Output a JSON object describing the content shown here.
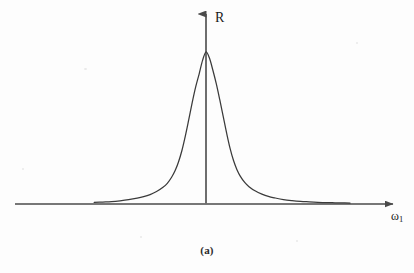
{
  "figure": {
    "caption": "(a)",
    "y_axis_label": "R",
    "x_axis_label_base": "ω",
    "x_axis_label_sub": "1",
    "line_color": "#3a3a3a",
    "axis_color": "#4a4a4a",
    "background_color": "#fdfdfd"
  },
  "chart_data": {
    "type": "line",
    "title": "",
    "subtitle": "",
    "xlabel": "ω₁",
    "ylabel": "R",
    "caption": "(a)",
    "grid": false,
    "legend": null,
    "axis_style": "arrow-headed half-axes, origin at curve peak center",
    "xlim": [
      -2.6,
      3.35
    ],
    "ylim": [
      0,
      1.12
    ],
    "x_origin_px": 206,
    "y_baseline_px": 204,
    "peak": {
      "x": 0,
      "y": 1.0
    },
    "x": [
      -2.6,
      -2.4,
      -2.2,
      -2.0,
      -1.8,
      -1.6,
      -1.45,
      -1.3,
      -1.15,
      -1.0,
      -0.9,
      -0.8,
      -0.72,
      -0.64,
      -0.56,
      -0.48,
      -0.4,
      -0.32,
      -0.24,
      -0.16,
      -0.08,
      0.0,
      0.08,
      0.16,
      0.24,
      0.32,
      0.4,
      0.48,
      0.56,
      0.64,
      0.72,
      0.8,
      0.9,
      1.0,
      1.15,
      1.3,
      1.45,
      1.6,
      1.8,
      2.0,
      2.2,
      2.4,
      2.6,
      2.8,
      3.0,
      3.2,
      3.35
    ],
    "y": [
      0.01,
      0.013,
      0.016,
      0.021,
      0.028,
      0.038,
      0.048,
      0.062,
      0.082,
      0.11,
      0.136,
      0.176,
      0.218,
      0.276,
      0.352,
      0.448,
      0.556,
      0.668,
      0.77,
      0.855,
      0.945,
      1.0,
      0.96,
      0.88,
      0.79,
      0.686,
      0.576,
      0.466,
      0.366,
      0.286,
      0.226,
      0.182,
      0.142,
      0.114,
      0.085,
      0.065,
      0.05,
      0.04,
      0.029,
      0.022,
      0.017,
      0.014,
      0.011,
      0.009,
      0.008,
      0.007,
      0.006
    ],
    "series": [
      {
        "name": "R(ω₁)",
        "color": "#3a3a3a",
        "values": [
          0.01,
          0.013,
          0.016,
          0.021,
          0.028,
          0.038,
          0.048,
          0.062,
          0.082,
          0.11,
          0.136,
          0.176,
          0.218,
          0.276,
          0.352,
          0.448,
          0.556,
          0.668,
          0.77,
          0.855,
          0.945,
          1.0,
          0.96,
          0.88,
          0.79,
          0.686,
          0.576,
          0.466,
          0.366,
          0.286,
          0.226,
          0.182,
          0.142,
          0.114,
          0.085,
          0.065,
          0.05,
          0.04,
          0.029,
          0.022,
          0.017,
          0.014,
          0.011,
          0.009,
          0.008,
          0.007,
          0.006
        ]
      }
    ]
  }
}
